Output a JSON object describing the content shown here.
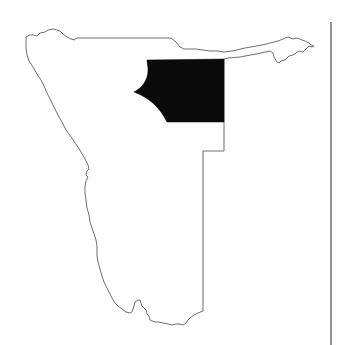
{
  "map": {
    "country": "Namibia",
    "background_color": "#ffffff",
    "outline_color": "#6e6e6e",
    "highlight_color": "#0a0a0a",
    "highlighted_region": "north-central region",
    "divider_color": "#4a4a4a"
  }
}
